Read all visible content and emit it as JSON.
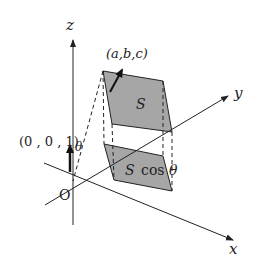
{
  "diagram": {
    "axes": {
      "z_label": "z",
      "y_label": "y",
      "x_label": "x",
      "origin_label": "O"
    },
    "upper_plane": {
      "label": "S",
      "fill": "#a6a6a6"
    },
    "lower_plane": {
      "label": "S cos θ",
      "label_s": "S",
      "label_cos": "cos",
      "label_theta": "θ",
      "fill": "#a6a6a6"
    },
    "normal_vector": {
      "label": "(a,b,c)"
    },
    "unit_vector": {
      "label": "(0 , 0 , 1)"
    },
    "angle_label": "θ",
    "colors": {
      "line": "#222222",
      "plane": "#a6a6a6",
      "background": "#ffffff"
    }
  }
}
